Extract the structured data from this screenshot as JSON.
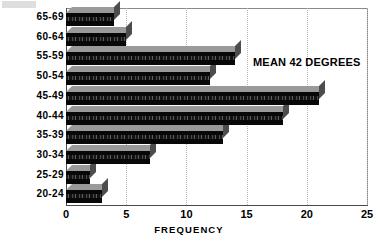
{
  "chart_data": {
    "type": "bar",
    "orientation": "horizontal",
    "title": "",
    "xlabel": "FREQUENCY",
    "ylabel": "",
    "categories": [
      "65-69",
      "60-64",
      "55-59",
      "50-54",
      "45-49",
      "40-44",
      "35-39",
      "30-34",
      "25-29",
      "20-24"
    ],
    "values": [
      4,
      5,
      14,
      12,
      21,
      18,
      13,
      7,
      2,
      3
    ],
    "series": [
      {
        "name": "Frequency",
        "values": [
          4,
          5,
          14,
          12,
          21,
          18,
          13,
          7,
          2,
          3
        ]
      }
    ],
    "xlim": [
      0,
      25
    ],
    "xticks": [
      0,
      5,
      10,
      15,
      20,
      25
    ],
    "xtick_labels": [
      "0",
      "5",
      "10",
      "15",
      "20",
      "25"
    ],
    "grid": "vertical-dotted",
    "legend": "none",
    "annotations": [
      {
        "text": "MEAN 42 DEGREES",
        "x": 15.5,
        "y": "55-59"
      }
    ],
    "style": {
      "bar_face_color": "#080808",
      "bar_top_color": "#9a9a9a",
      "bar_side_color": "#4d4d4d",
      "axis_color": "#4a4a4a",
      "gridline_color": "#b6b6b6",
      "background": "#ffffff",
      "three_d": true
    }
  },
  "artifact": {
    "label": "scan-edge-artifact"
  }
}
